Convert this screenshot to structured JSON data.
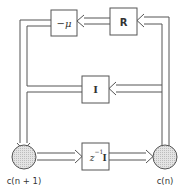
{
  "diagram": {
    "type": "block-diagram",
    "blocks": {
      "neg_mu": {
        "label": "−μ"
      },
      "R": {
        "label": "R"
      },
      "I": {
        "label": "I"
      },
      "delay": {
        "label_base": "z",
        "label_exp": "−1",
        "label_tail": "I"
      }
    },
    "nodes": {
      "left": {
        "label": "c(n + 1)"
      },
      "right": {
        "label": "c(n)"
      }
    },
    "colors": {
      "line": "#555555",
      "node_fill": "#d9d9d9",
      "box_fill": "#ffffff"
    },
    "edges": [
      {
        "from": "c(n)",
        "to": "R"
      },
      {
        "from": "R",
        "to": "−μ"
      },
      {
        "from": "−μ",
        "to": "c(n + 1)"
      },
      {
        "from": "c(n)",
        "to": "I"
      },
      {
        "from": "I",
        "to": "c(n + 1)"
      },
      {
        "from": "c(n + 1)",
        "to": "z⁻¹I"
      },
      {
        "from": "z⁻¹I",
        "to": "c(n)"
      }
    ]
  }
}
